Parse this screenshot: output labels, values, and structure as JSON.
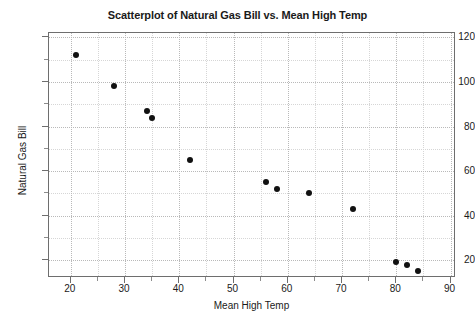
{
  "chart_data": {
    "type": "scatter",
    "title": "Scatterplot of Natural Gas Bill vs. Mean High Temp",
    "xlabel": "Mean High Temp",
    "ylabel": "Natural Gas Bill",
    "xlim": [
      16,
      91
    ],
    "ylim": [
      12,
      122
    ],
    "grid": true,
    "legend": null,
    "x_ticks": [
      20,
      30,
      40,
      50,
      60,
      70,
      80,
      90
    ],
    "x_minor_ticks": [
      25,
      35,
      45,
      55,
      65,
      75,
      85
    ],
    "y_ticks": [
      20,
      40,
      60,
      80,
      100,
      120
    ],
    "y_minor_ticks": [
      30,
      50,
      70,
      90,
      110
    ],
    "x": [
      21,
      28,
      34,
      35,
      42,
      56,
      58,
      64,
      72,
      80,
      82,
      84
    ],
    "y": [
      112,
      98,
      87,
      84,
      65,
      55,
      52,
      50,
      43,
      19,
      18,
      15
    ],
    "points": [
      {
        "x": 21,
        "y": 112
      },
      {
        "x": 28,
        "y": 98
      },
      {
        "x": 34,
        "y": 87
      },
      {
        "x": 35,
        "y": 84
      },
      {
        "x": 42,
        "y": 65
      },
      {
        "x": 56,
        "y": 55
      },
      {
        "x": 58,
        "y": 52
      },
      {
        "x": 64,
        "y": 50
      },
      {
        "x": 72,
        "y": 43
      },
      {
        "x": 80,
        "y": 19
      },
      {
        "x": 82,
        "y": 18
      },
      {
        "x": 84,
        "y": 15
      }
    ],
    "marker": {
      "shape": "circle",
      "color": "#111111",
      "size": 6
    },
    "colors": {
      "axis": "#6e6e6e",
      "grid_major": "#b9b9b9",
      "grid_minor": "#d6d6d6",
      "text": "#1a1a1a",
      "background": "#ffffff"
    }
  }
}
